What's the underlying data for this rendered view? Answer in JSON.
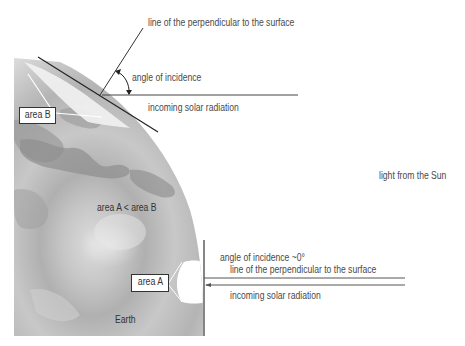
{
  "diagram": {
    "labels": {
      "perpendicular_top": "line of the perpendicular to the surface",
      "angle_top": "angle of incidence",
      "radiation_top": "incoming solar radiation",
      "area_b": "area B",
      "comparison": "area A < area B",
      "sun_light": "light from the Sun",
      "angle_bottom": "angle of incidence ~0°",
      "perpendicular_bottom": "line of the perpendicular to the surface",
      "area_a": "area A",
      "radiation_bottom": "incoming solar radiation",
      "earth": "Earth"
    },
    "colors": {
      "earth_light": "#e2e2e2",
      "earth_mid": "#b9b9b9",
      "earth_dark": "#8c8c8c",
      "line": "#333333",
      "text": "#4a4a4a"
    }
  }
}
